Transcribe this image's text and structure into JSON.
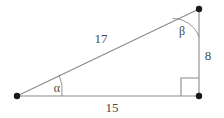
{
  "figure": {
    "background_color": "#ffffff",
    "stroke_color": "#8a8a8a",
    "vertex_color": "#1a1a1a",
    "text_color": "#4a4a4a",
    "vertices": [
      {
        "name": "left-vertex",
        "x": 17,
        "y": 96
      },
      {
        "name": "bottom-right-vertex",
        "x": 199,
        "y": 96
      },
      {
        "name": "top-right-vertex",
        "x": 199,
        "y": 9
      }
    ],
    "sides": [
      {
        "name": "hypotenuse",
        "label": "17",
        "label_x": 101,
        "label_y": 38
      },
      {
        "name": "vertical-leg",
        "label": "8",
        "label_x": 208,
        "label_y": 55
      },
      {
        "name": "base-leg",
        "label": "15",
        "label_x": 112,
        "label_y": 107
      }
    ],
    "angles": [
      {
        "name": "angle-alpha",
        "label": "α",
        "label_x": 57,
        "label_y": 88,
        "vertex": "left-vertex"
      },
      {
        "name": "angle-beta",
        "label": "β",
        "label_x": 182,
        "label_y": 31,
        "vertex": "top-right-vertex"
      },
      {
        "name": "right-angle",
        "label": "",
        "label_x": 0,
        "label_y": 0,
        "vertex": "bottom-right-vertex"
      }
    ]
  }
}
